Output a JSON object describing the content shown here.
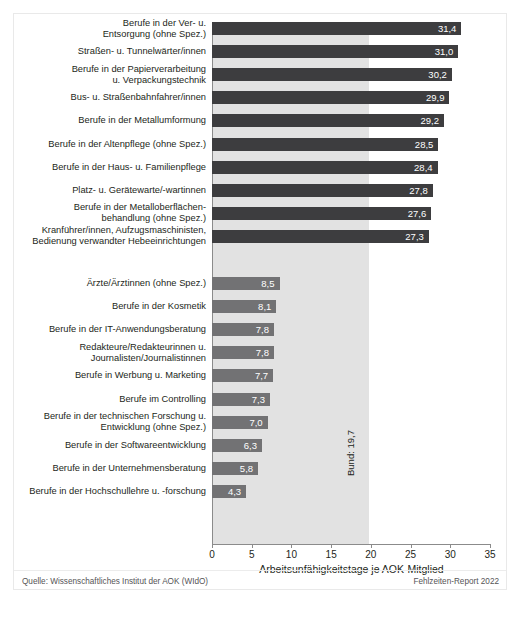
{
  "chart_data": {
    "type": "bar",
    "orientation": "horizontal",
    "title": "",
    "xlabel": "Arbeitsunfähigkeitstage je AOK-Mitglied",
    "ylabel": "",
    "xlim": [
      0,
      35
    ],
    "xticks": [
      0,
      5,
      10,
      15,
      20,
      25,
      30,
      35
    ],
    "xticklabels": [
      "0",
      "5",
      "10",
      "15",
      "20",
      "25",
      "30",
      "35"
    ],
    "grid": false,
    "legend": null,
    "decimal_separator": ",",
    "reference_line": {
      "label": "Bund: 19,7",
      "value": 19.7,
      "shaded_band": true
    },
    "groups": [
      {
        "name": "highest",
        "color": "#3d3d3f",
        "categories": [
          "Berufe in der Ver- u.\nEntsorgung (ohne Spez.)",
          "Straßen- u. Tunnelwärter/innen",
          "Berufe in der Papierverarbeitung\nu. Verpackungstechnik",
          "Bus- u. Straßenbahnfahrer/innen",
          "Berufe in der Metallumformung",
          "Berufe in der Altenpflege (ohne Spez.)",
          "Berufe in der Haus- u. Familienpflege",
          "Platz- u. Gerätewarte/-wartinnen",
          "Berufe in der Metalloberflächen-\nbehandlung (ohne Spez.)",
          "Kranführer/innen, Aufzugsmaschinisten,\nBedienung verwandter Hebeeinrichtungen"
        ],
        "values": [
          31.4,
          31.0,
          30.2,
          29.9,
          29.2,
          28.5,
          28.4,
          27.8,
          27.6,
          27.3
        ],
        "value_labels": [
          "31,4",
          "31,0",
          "30,2",
          "29,9",
          "29,2",
          "28,5",
          "28,4",
          "27,8",
          "27,6",
          "27,3"
        ]
      },
      {
        "name": "lowest",
        "color": "#727274",
        "categories": [
          "Ärzte/Ärztinnen (ohne Spez.)",
          "Berufe in der Kosmetik",
          "Berufe in der IT-Anwendungsberatung",
          "Redakteure/Redakteurinnen u.\nJournalisten/Journalistinnen",
          "Berufe in Werbung u. Marketing",
          "Berufe im Controlling",
          "Berufe in der technischen Forschung u.\nEntwicklung (ohne Spez.)",
          "Berufe in der Softwareentwicklung",
          "Berufe in der Unternehmensberatung",
          "Berufe in der Hochschullehre u. -forschung"
        ],
        "values": [
          8.5,
          8.1,
          7.8,
          7.8,
          7.7,
          7.3,
          7.0,
          6.3,
          5.8,
          4.3
        ],
        "value_labels": [
          "8,5",
          "8,1",
          "7,8",
          "7,8",
          "7,7",
          "7,3",
          "7,0",
          "6,3",
          "5,8",
          "4,3"
        ]
      }
    ]
  },
  "footer": {
    "source": "Quelle: Wissenschaftliches Institut der AOK (WIdO)",
    "report": "Fehlzeiten-Report 2022"
  }
}
